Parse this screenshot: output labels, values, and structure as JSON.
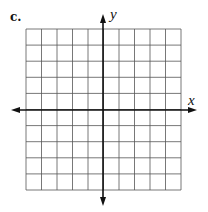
{
  "part_label": "c.",
  "axes": {
    "x_label": "x",
    "y_label": "y"
  },
  "grid": {
    "columns": 10,
    "rows": 10,
    "line_color": "#555555",
    "axis_color": "#111111"
  }
}
